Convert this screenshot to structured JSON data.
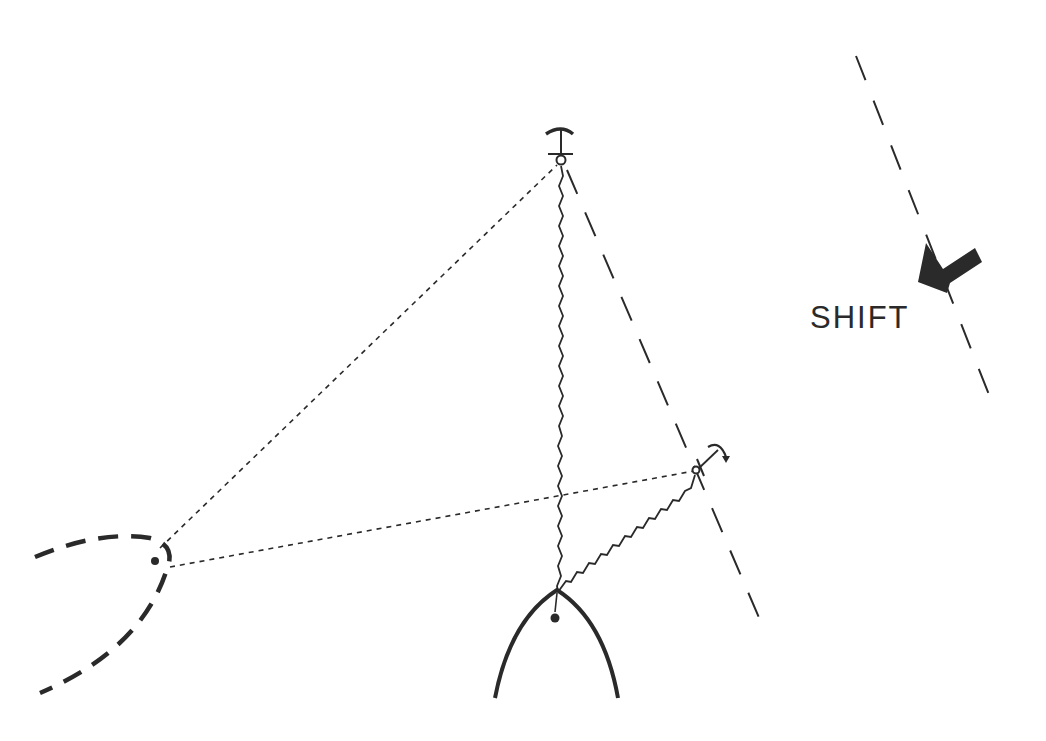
{
  "diagram": {
    "type": "anchoring-two-anchors-wind-shift",
    "labels": {
      "shift": "SHIFT"
    },
    "colors": {
      "ink": "#2a2a2a",
      "background": "#ffffff"
    },
    "elements": {
      "boat": {
        "description": "bow of boat (solid outline) with bow point",
        "bow": [
          556,
          590
        ],
        "pivot": [
          555,
          618
        ]
      },
      "boat_swung": {
        "description": "swung boat position (heavy dashed outline)",
        "pivot": [
          155,
          561
        ]
      },
      "anchor_main": {
        "description": "first anchor set upwind",
        "ring": [
          561,
          160
        ]
      },
      "anchor_second": {
        "description": "second anchor set after shift",
        "ring": [
          697,
          470
        ]
      },
      "rode_main": {
        "description": "wavy rode from bow to main anchor"
      },
      "rode_second": {
        "description": "wavy rode from bow to second anchor"
      },
      "swing_lines": {
        "description": "dotted lines from swung position to both anchors"
      },
      "old_wind_line": {
        "description": "long dashed line through main anchor"
      },
      "new_wind_line": {
        "description": "long dashed wind-direction line on right"
      },
      "shift_arrow": {
        "description": "solid arrow pointing down-left indicating wind shift"
      }
    }
  }
}
